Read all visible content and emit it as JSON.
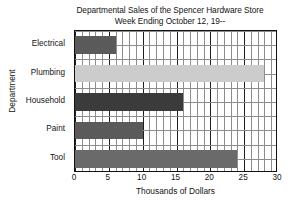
{
  "chart_data": {
    "type": "bar",
    "orientation": "horizontal",
    "title": "Departmental Sales of the Spencer Hardware Store",
    "subtitle": "Week Ending October 12, 19--",
    "title_lines": [
      "Departmental Sales of the Spencer Hardware Store",
      "Week Ending October 12, 19--"
    ],
    "categories": [
      "Electrical",
      "Plumbing",
      "Household",
      "Paint",
      "Tool"
    ],
    "values": [
      6,
      28,
      16,
      10,
      24
    ],
    "bar_colors": [
      "#5a5a5a",
      "#cccccc",
      "#3b3b3b",
      "#5a5a5a",
      "#6a6a6a"
    ],
    "xlabel": "Thousands of Dollars",
    "ylabel": "Department",
    "xlim": [
      0,
      30
    ],
    "xticks": [
      0,
      5,
      10,
      15,
      20,
      25,
      30
    ],
    "xtick_labels": [
      "0",
      "5",
      "10",
      "15",
      "20",
      "25",
      "30"
    ],
    "minor_tick_step": 1,
    "major_tick_step": 5,
    "grid": true,
    "grid_color": "#8d8d8d",
    "major_grid_color": "#1d1d1d",
    "legend": null,
    "legend_position": "none",
    "axis_color": "#111111",
    "background": "#ffffff"
  }
}
